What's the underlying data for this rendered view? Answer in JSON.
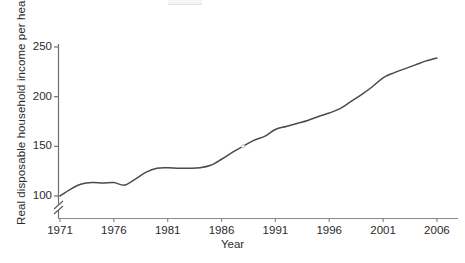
{
  "chart_data": {
    "type": "line",
    "title": "",
    "xlabel": "Year",
    "ylabel": "Real disposable household income per head",
    "xlim": [
      1971,
      2006
    ],
    "ylim": [
      88,
      252
    ],
    "grid": false,
    "legend": null,
    "axis_break": {
      "axis": "y",
      "below": 100,
      "symbol": "//"
    },
    "xticks": [
      1971,
      1976,
      1981,
      1986,
      1991,
      1996,
      2001,
      2006
    ],
    "xtick_labels": [
      "1971",
      "1976",
      "1981",
      "1986",
      "1991",
      "1996",
      "2001",
      "2006"
    ],
    "yticks": [
      100,
      150,
      200,
      250
    ],
    "ytick_labels": [
      "100",
      "150",
      "200",
      "250"
    ],
    "series": [
      {
        "name": "Real disposable household income per head",
        "color": "#4a4a4a",
        "x": [
          1971,
          1972,
          1973,
          1974,
          1975,
          1976,
          1977,
          1978,
          1979,
          1980,
          1981,
          1982,
          1983,
          1984,
          1985,
          1986,
          1987,
          1988,
          1989,
          1990,
          1991,
          1992,
          1993,
          1994,
          1995,
          1996,
          1997,
          1998,
          1999,
          2000,
          2001,
          2002,
          2003,
          2004,
          2005,
          2006
        ],
        "y": [
          100,
          107,
          112,
          113.5,
          113,
          113.5,
          111,
          117,
          124,
          128,
          128.5,
          128,
          128,
          128.5,
          131,
          137,
          144,
          150,
          156,
          160,
          167,
          170,
          173,
          176,
          180,
          183.5,
          188,
          195,
          202,
          210,
          219,
          224,
          228,
          232,
          236,
          239
        ]
      }
    ],
    "annotations": []
  },
  "axis": {
    "ytick_top_label": "250",
    "break_marker": "//"
  }
}
